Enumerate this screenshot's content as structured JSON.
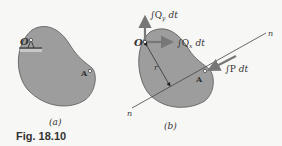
{
  "figure": {
    "caption": "Fig. 18.10",
    "colors": {
      "body_fill": "#9d9d9d",
      "body_stroke": "#555555",
      "arrow_color": "#777777",
      "line_color": "#444444",
      "text": "#333333",
      "background": "#f7f7f5"
    },
    "panel_a": {
      "label": "(a)",
      "point_O": "O",
      "point_A": "A"
    },
    "panel_b": {
      "label": "(b)",
      "point_O": "O",
      "point_A": "A",
      "r_label": "r",
      "line_label_top": "n",
      "line_label_bottom": "n",
      "impulse_Qy": "∫Q",
      "impulse_Qy_sub": "y",
      "impulse_Qy_dt": "dt",
      "impulse_Qx": "∫Q",
      "impulse_Qx_sub": "x",
      "impulse_Qx_dt": "dt",
      "impulse_P": "∫P",
      "impulse_P_dt": "dt"
    }
  }
}
